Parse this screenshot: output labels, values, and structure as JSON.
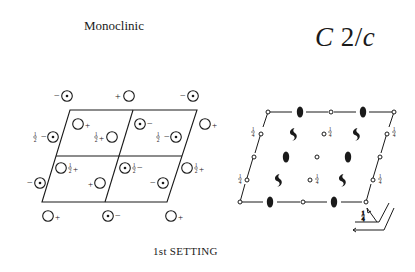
{
  "header": {
    "crystal_system": "Monoclinic",
    "space_group": {
      "letter": "C",
      "number": "2",
      "slash": "/",
      "glide": "c"
    }
  },
  "footer": {
    "setting_label_prefix": "1",
    "setting_label_suffix": "st SETTING",
    "setting_full": "1st SETTING"
  },
  "general_positions_diagram": {
    "description": "Equivalent positions diagram (left)",
    "markers": [
      {
        "type": "circle-dot",
        "sign": "-",
        "frac": "",
        "position": "top-left-outside"
      },
      {
        "type": "circle",
        "sign": "+",
        "frac": "",
        "position": "top-middle-outside"
      },
      {
        "type": "circle-dot",
        "sign": "-",
        "frac": "",
        "position": "top-right-outside"
      },
      {
        "type": "circle-dot",
        "sign": "-",
        "frac": "½",
        "position": "left-upper"
      },
      {
        "type": "circle",
        "sign": "+",
        "frac": "",
        "position": "cell-1-upper"
      },
      {
        "type": "circle",
        "sign": "+",
        "frac": "½",
        "position": "cell-1-lower"
      },
      {
        "type": "circle-dot",
        "sign": "-",
        "frac": "",
        "position": "cell-2-upper"
      },
      {
        "type": "circle-dot",
        "sign": "-",
        "frac": "½",
        "position": "cell-2-lower"
      },
      {
        "type": "circle",
        "sign": "+",
        "frac": "",
        "position": "right-upper"
      },
      {
        "type": "circle",
        "sign": "+",
        "frac": "½",
        "position": "cell-3-upper"
      },
      {
        "type": "circle",
        "sign": "+",
        "frac": "",
        "position": "cell-3-lower"
      },
      {
        "type": "circle-dot",
        "sign": "-",
        "frac": "½",
        "position": "cell-4-upper"
      },
      {
        "type": "circle-dot",
        "sign": "-",
        "frac": "",
        "position": "cell-4-lower"
      },
      {
        "type": "circle",
        "sign": "+",
        "frac": "½",
        "position": "right-lower"
      },
      {
        "type": "circle-dot",
        "sign": "-",
        "frac": "",
        "position": "left-lower"
      },
      {
        "type": "circle",
        "sign": "+",
        "frac": "",
        "position": "bottom-left-outside"
      },
      {
        "type": "circle-dot",
        "sign": "-",
        "frac": "",
        "position": "bottom-middle-outside"
      },
      {
        "type": "circle",
        "sign": "+",
        "frac": "",
        "position": "bottom-right-outside"
      }
    ]
  },
  "symmetry_elements_diagram": {
    "description": "Symmetry elements diagram (right)",
    "quarter_label": "¼",
    "elements": [
      "inversion-center",
      "two-fold-axis",
      "two-fold-screw-axis",
      "glide-plane"
    ],
    "axis_labels": {
      "corner_fraction": "¼"
    }
  }
}
